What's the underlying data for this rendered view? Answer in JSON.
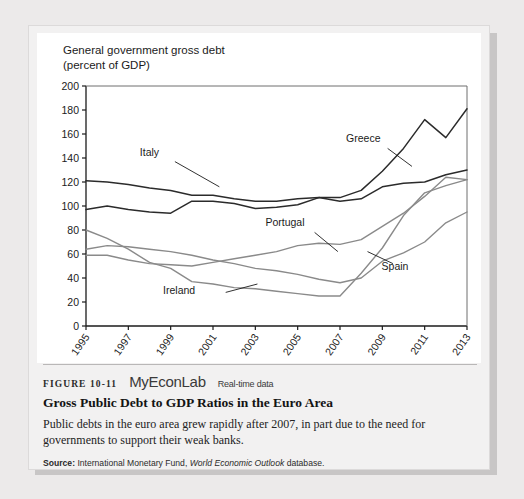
{
  "figure": {
    "label": "FIGURE 10-11",
    "brand": "MyEconLab",
    "brand_tag": "Real-time data",
    "title": "Gross Public Debt to GDP Ratios in the Euro Area",
    "description": "Public debts in the euro area grew rapidly after 2007, in part due to the need for governments to support their weak banks.",
    "source_prefix": "Source:",
    "source_text_1": "International Monetary Fund,",
    "source_italic": "World Economic Outlook",
    "source_text_2": "database."
  },
  "chart_data": {
    "type": "line",
    "axis_note_line1": "General government gross debt",
    "axis_note_line2": "(percent of GDP)",
    "xlabel": "",
    "ylabel": "percent of GDP",
    "x": [
      1995,
      1996,
      1997,
      1998,
      1999,
      2000,
      2001,
      2002,
      2003,
      2004,
      2005,
      2006,
      2007,
      2008,
      2009,
      2010,
      2011,
      2012,
      2013
    ],
    "xlim": [
      1995,
      2013
    ],
    "ylim": [
      0,
      200
    ],
    "ytick_step": 20,
    "yticks": [
      0,
      20,
      40,
      60,
      80,
      100,
      120,
      140,
      160,
      180,
      200
    ],
    "xticks": [
      1995,
      1997,
      1999,
      2001,
      2003,
      2005,
      2007,
      2009,
      2011,
      2013
    ],
    "grid": false,
    "legend": "inline-labels",
    "series": [
      {
        "name": "Greece",
        "color": "#2b2b2b",
        "width": 1.5,
        "label_x": 2008.1,
        "label_y": 153,
        "leader": [
          [
            2009.25,
            148
          ],
          [
            2010.4,
            133
          ]
        ],
        "values": [
          97,
          100,
          97,
          95,
          94,
          104,
          104,
          102,
          98,
          99,
          101,
          107,
          107,
          113,
          129,
          148,
          172,
          157,
          181
        ]
      },
      {
        "name": "Italy",
        "color": "#2b2b2b",
        "width": 1.5,
        "label_x": 1998.0,
        "label_y": 142,
        "leader": [
          [
            1999.2,
            137
          ],
          [
            2001.3,
            116
          ]
        ],
        "values": [
          121,
          120,
          118,
          115,
          113,
          109,
          109,
          106,
          104,
          104,
          106,
          107,
          104,
          106,
          116,
          119,
          120,
          126,
          130
        ]
      },
      {
        "name": "Portugal",
        "color": "#8a8a8a",
        "width": 1.4,
        "label_x": 2004.4,
        "label_y": 83,
        "leader": [
          [
            2005.8,
            78
          ],
          [
            2006.9,
            62
          ]
        ],
        "values": [
          59,
          59,
          55,
          52,
          51,
          50,
          53,
          56,
          59,
          62,
          67,
          69,
          68,
          72,
          83,
          94,
          108,
          124,
          122
        ]
      },
      {
        "name": "Spain",
        "color": "#8a8a8a",
        "width": 1.4,
        "label_x": 2009.6,
        "label_y": 47,
        "leader": [
          [
            2009.5,
            52
          ],
          [
            2008.3,
            62
          ]
        ],
        "values": [
          64,
          67,
          66,
          64,
          62,
          59,
          55,
          52,
          48,
          46,
          43,
          39,
          36,
          40,
          54,
          61,
          70,
          86,
          95
        ]
      },
      {
        "name": "Ireland",
        "color": "#8a8a8a",
        "width": 1.4,
        "label_x": 1999.4,
        "label_y": 27,
        "leader": [
          [
            2001.6,
            28
          ],
          [
            2003.1,
            35
          ]
        ],
        "values": [
          80,
          73,
          64,
          53,
          48,
          37,
          35,
          32,
          31,
          29,
          27,
          25,
          25,
          44,
          65,
          92,
          111,
          117,
          122
        ]
      }
    ]
  }
}
